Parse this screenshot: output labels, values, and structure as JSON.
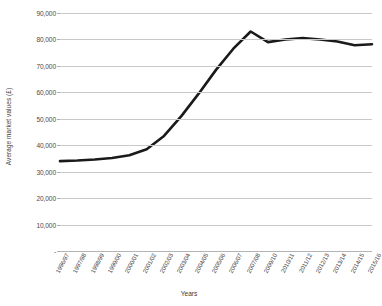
{
  "chart_data": {
    "type": "line",
    "title": "",
    "subtitle": "",
    "xlabel": "Years",
    "ylabel": "Average market values (£)",
    "ylim": [
      0,
      90000
    ],
    "ytick_values": [
      0,
      10000,
      20000,
      30000,
      40000,
      50000,
      60000,
      70000,
      80000,
      90000
    ],
    "ytick_labels": [
      "-",
      "10,000",
      "20,000",
      "30,000",
      "40,000",
      "50,000",
      "60,000",
      "70,000",
      "80,000",
      "90,000"
    ],
    "grid": "horizontal",
    "legend": "none",
    "categories": [
      "1996/97",
      "1997/98",
      "1998/99",
      "1999/00",
      "2000/01",
      "2001/02",
      "2002/03",
      "2003/04",
      "2004/05",
      "2005/06",
      "2006/07",
      "2007/08",
      "2009/10",
      "2010/11",
      "2011/12",
      "2012/13",
      "2013/14",
      "2014/15",
      "2015/16"
    ],
    "series": [
      {
        "name": "Average market values",
        "color": "#1a1a1a",
        "values": [
          34000,
          34200,
          34600,
          35200,
          36200,
          38500,
          43500,
          51000,
          59500,
          68500,
          76500,
          83000,
          79000,
          80000,
          80500,
          80000,
          79200,
          77800,
          78200
        ]
      }
    ],
    "annotations": []
  },
  "style": {
    "grid_color": "#c9c9c9",
    "line_color": "#1a1a1a",
    "text_color": "#3f3f3f",
    "background": "#ffffff"
  }
}
